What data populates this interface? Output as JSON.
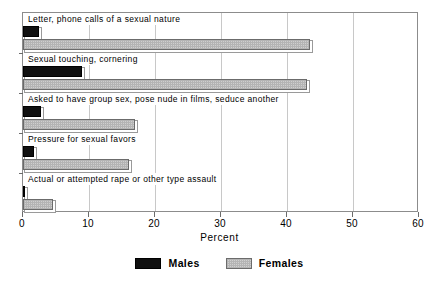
{
  "chart_data": {
    "type": "bar",
    "orientation": "horizontal",
    "title": "",
    "xlabel": "Percent",
    "ylabel": "",
    "xlim": [
      0,
      60
    ],
    "xticks": [
      0,
      10,
      20,
      30,
      40,
      50,
      60
    ],
    "xtick_labels": [
      "0",
      "10",
      "20",
      "30",
      "40",
      "50",
      "60"
    ],
    "grid": true,
    "legend_position": "bottom",
    "categories": [
      "Letter, phone calls of a sexual nature",
      "Sexual touching, cornering",
      "Asked to have group sex, pose nude in films, seduce another",
      "Pressure for sexual favors",
      "Actual or attempted rape or other type assault"
    ],
    "series": [
      {
        "name": "Males",
        "color": "#101010",
        "values": [
          2.4,
          9.0,
          2.7,
          1.7,
          0.3
        ]
      },
      {
        "name": "Females",
        "color": "#cfcfcf",
        "values": [
          43.5,
          43.0,
          17.0,
          16.0,
          4.5
        ]
      }
    ]
  },
  "legend": {
    "entries": [
      {
        "label": "Males"
      },
      {
        "label": "Females"
      }
    ]
  },
  "colors": {
    "males": "#101010",
    "females": "#cfcfcf",
    "frame": "#8c8c8c",
    "grid": "#c8c8c8",
    "text": "#000000"
  }
}
